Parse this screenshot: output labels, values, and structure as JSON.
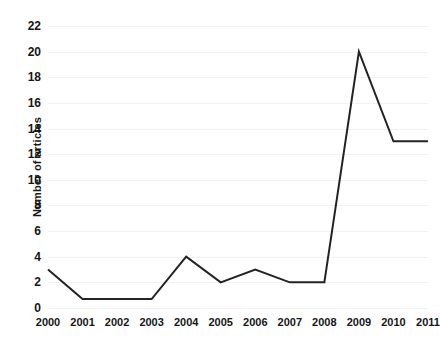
{
  "chart_data": {
    "type": "line",
    "title": "",
    "xlabel": "",
    "ylabel": "Number of  articles",
    "categories": [
      "2000",
      "2001",
      "2002",
      "2003",
      "2004",
      "2005",
      "2006",
      "2007",
      "2008",
      "2009",
      "2010",
      "2011"
    ],
    "values": [
      3,
      0.7,
      0.7,
      0.7,
      4,
      2,
      3,
      2,
      2,
      20,
      13,
      13
    ],
    "series": [
      {
        "name": "Number of articles",
        "values": [
          3,
          0.7,
          0.7,
          0.7,
          4,
          2,
          3,
          2,
          2,
          20,
          13,
          13
        ]
      }
    ],
    "ylim": [
      0,
      22
    ],
    "ytick_labels": [
      "0",
      "2",
      "4",
      "6",
      "8",
      "10",
      "12",
      "14",
      "16",
      "18",
      "20",
      "22"
    ],
    "ytick_values": [
      0,
      2,
      4,
      6,
      8,
      10,
      12,
      14,
      16,
      18,
      20,
      22
    ],
    "xtick_labels": [
      "2000",
      "2001",
      "2002",
      "2003",
      "2004",
      "2005",
      "2006",
      "2007",
      "2008",
      "2009",
      "2010",
      "2011"
    ],
    "grid": true,
    "grid_axis": "y",
    "legend": false,
    "legend_position": "none",
    "line_color": "#232323",
    "grid_color": "#f1f1f3",
    "background_color": "#ffffff",
    "annotations": []
  }
}
